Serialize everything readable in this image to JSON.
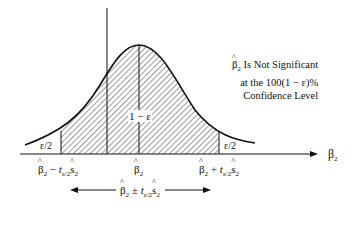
{
  "diagram": {
    "type": "t-distribution confidence interval",
    "axis_label": "β",
    "axis_label_sub": "2",
    "center_area_label": "1 − ε",
    "left_tail_label": "ε/2",
    "right_tail_label": "ε/2",
    "note": {
      "line1_prefix": "β",
      "line1_sub": "2",
      "line1_rest": " Is Not Significant",
      "line2": "at the 100(1 − ε)%",
      "line3": "Confidence Level"
    },
    "ticks": {
      "left": {
        "b": "β",
        "sub": "2",
        "op": " − ",
        "t": "t",
        "tsub": "ε/2",
        "s": "s",
        "ssub": "2"
      },
      "center": {
        "b": "β",
        "sub": "2"
      },
      "right": {
        "b": "β",
        "sub": "2",
        "op": " + ",
        "t": "t",
        "tsub": "ε/2",
        "s": "s",
        "ssub": "2"
      }
    },
    "interval": {
      "b": "β",
      "sub": "2",
      "op": " ± ",
      "t": "t",
      "tsub": "ε/2",
      "s": "s",
      "ssub": "2"
    },
    "colors": {
      "ink": "#111111",
      "background": "#ffffff"
    }
  }
}
